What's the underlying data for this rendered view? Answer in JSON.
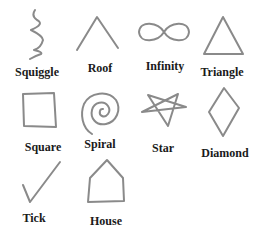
{
  "diagram": {
    "stroke_color": "#8a8a8a",
    "label_color": "#1a1a1a",
    "shapes": [
      {
        "name": "squiggle",
        "label": "Squiggle"
      },
      {
        "name": "roof",
        "label": "Roof"
      },
      {
        "name": "infinity",
        "label": "Infinity"
      },
      {
        "name": "triangle",
        "label": "Triangle"
      },
      {
        "name": "square",
        "label": "Square"
      },
      {
        "name": "spiral",
        "label": "Spiral"
      },
      {
        "name": "star",
        "label": "Star"
      },
      {
        "name": "diamond",
        "label": "Diamond"
      },
      {
        "name": "tick",
        "label": "Tick"
      },
      {
        "name": "house",
        "label": "House"
      }
    ]
  }
}
